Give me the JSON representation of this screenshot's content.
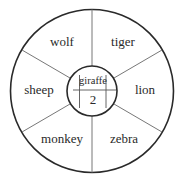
{
  "diagram": {
    "outer_sectors": [
      {
        "label": "wolf"
      },
      {
        "label": "tiger"
      },
      {
        "label": "lion"
      },
      {
        "label": "zebra"
      },
      {
        "label": "monkey"
      },
      {
        "label": "sheep"
      }
    ],
    "center": {
      "top_label": "giraffe",
      "bottom_value": "2"
    },
    "colors": {
      "stroke": "#2a2a2a",
      "divider": "#777777",
      "background": "#ffffff"
    }
  }
}
